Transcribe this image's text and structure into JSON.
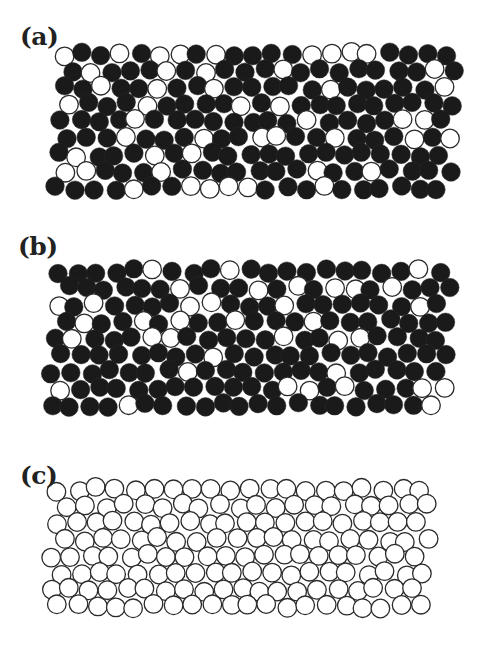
{
  "figure": {
    "panels": [
      {
        "id": "a",
        "label": "(a)",
        "label_pos": [
          20,
          22
        ],
        "top": 0,
        "height": 215,
        "region": {
          "x0": 55,
          "x1": 465,
          "y0": 45,
          "y1": 200,
          "skew": 8
        },
        "radius": 9.3,
        "fill_fraction": 0.78,
        "seed": 11
      },
      {
        "id": "b",
        "label": "(b)",
        "label_pos": [
          18,
          232
        ],
        "top": 220,
        "height": 215,
        "region": {
          "x0": 50,
          "x1": 460,
          "y0": 262,
          "y1": 424,
          "skew": 10
        },
        "radius": 9.3,
        "fill_fraction": 0.82,
        "seed": 29
      },
      {
        "id": "c",
        "label": "(c)",
        "label_pos": [
          20,
          461
        ],
        "top": 440,
        "height": 214,
        "region": {
          "x0": 50,
          "x1": 445,
          "y0": 480,
          "y1": 630,
          "skew": 12
        },
        "radius": 9.3,
        "fill_fraction": 0.0,
        "seed": 47
      }
    ],
    "colors": {
      "filled": "#1a1a1a",
      "outline": "#2a2a2a",
      "open": "#ffffff"
    }
  }
}
